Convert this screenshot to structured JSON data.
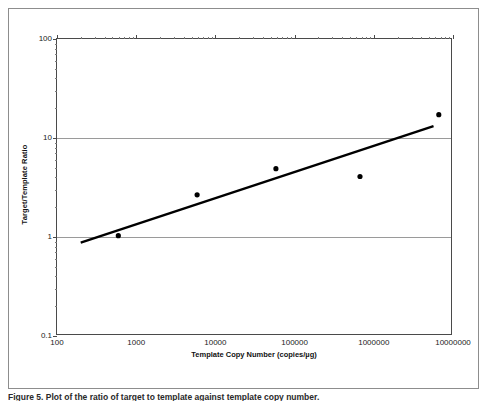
{
  "figure": {
    "caption": "Figure 5. Plot of the ratio of target to template against template copy number."
  },
  "chart_data": {
    "type": "scatter",
    "title": "",
    "xlabel": "Template Copy Number (copies/µg)",
    "ylabel": "Target/Template Ratio",
    "xscale": "log",
    "yscale": "log",
    "xlim": [
      100,
      10000000
    ],
    "ylim": [
      0.1,
      100
    ],
    "grid": "horizontal",
    "legend": "none",
    "xticks": [
      "100",
      "1000",
      "10000",
      "100000",
      "1000000",
      "10000000"
    ],
    "xtick_values": [
      100,
      1000,
      10000,
      100000,
      1000000,
      10000000
    ],
    "yticks": [
      "0.1",
      "1",
      "10",
      "100"
    ],
    "ytick_values": [
      0.1,
      1,
      10,
      100
    ],
    "gridline_values": [
      1,
      10
    ],
    "series": [
      {
        "name": "Measured ratio",
        "marker": "filled-circle",
        "color": "#000000",
        "x": [
          600,
          6000,
          60000,
          700000,
          7000000
        ],
        "y": [
          1.0,
          2.6,
          4.8,
          4.0,
          17.0
        ]
      },
      {
        "name": "Regression line",
        "type": "line",
        "color": "#000000",
        "x": [
          200,
          6000000
        ],
        "y": [
          0.85,
          13.0
        ]
      }
    ]
  }
}
